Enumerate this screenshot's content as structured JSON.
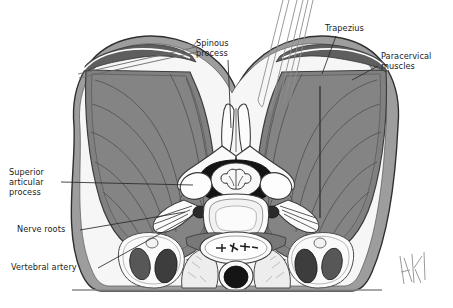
{
  "figure": {
    "width": 453,
    "height": 308,
    "background": "#ffffff",
    "signature": "AK"
  },
  "labels": {
    "superior_articular_process": "Superior\narticular\nprocess",
    "nerve_roots": "Nerve roots",
    "vertebral_artery": "Vertebral artery",
    "spinous_process": "Spinous\nprocess",
    "trapezius": "Trapezius",
    "paracervical_muscles": "Paracervical\nmuscles"
  },
  "colors": {
    "muscle_fill": "#808080",
    "muscle_dark": "#6e6e6e",
    "skin_fill": "#9a9a9a",
    "skin_light": "#f4f4f4",
    "bone_fill": "#fbfbfb",
    "bone_line": "#4a4a4a",
    "canal_dark": "#1a1a1a",
    "vessel_dark": "#555555",
    "vessel_black": "#151515",
    "thyroid_fill": "#ececec",
    "outline": "#3a3a3a",
    "leader_line": "#2b2b2b",
    "text": "#1c1c1c",
    "needle_line": "#8a8a8a"
  },
  "structures": [
    "left paracervical muscle mass",
    "right paracervical muscle mass",
    "trapezius layer",
    "retractor blade",
    "needle instruments",
    "bifid spinous process",
    "vertebral lamina",
    "spinal canal with spinal cord",
    "superior articular processes",
    "transverse processes",
    "vertebral arteries in foramina transversaria",
    "nerve roots",
    "vertebral body",
    "carotid arteries",
    "jugular veins",
    "thyroid lobes",
    "trachea with cartilage rings",
    "esophagus"
  ]
}
